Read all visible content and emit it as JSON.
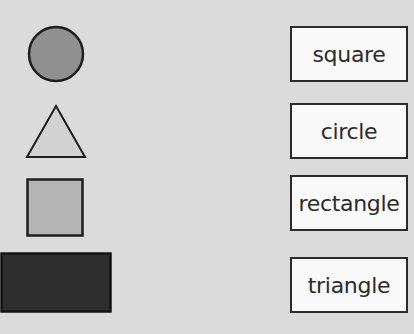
{
  "canvas": {
    "background_color": "#dbdbdb"
  },
  "shapes": [
    {
      "name": "circle",
      "fill": "#909090",
      "stroke": "#1e1e1e"
    },
    {
      "name": "triangle",
      "fill": "#d2d2d2",
      "stroke": "#1e1e1e"
    },
    {
      "name": "square",
      "fill": "#b4b4b4",
      "stroke": "#1e1e1e"
    },
    {
      "name": "rectangle",
      "fill": "#2e2e2e",
      "stroke": "#151515"
    }
  ],
  "labels": [
    {
      "text": "square"
    },
    {
      "text": "circle"
    },
    {
      "text": "rectangle"
    },
    {
      "text": "triangle"
    }
  ],
  "label_card_style": {
    "background": "#f9f9f9",
    "border_color": "#2b2b2b",
    "text_color": "#2b2b2b"
  }
}
